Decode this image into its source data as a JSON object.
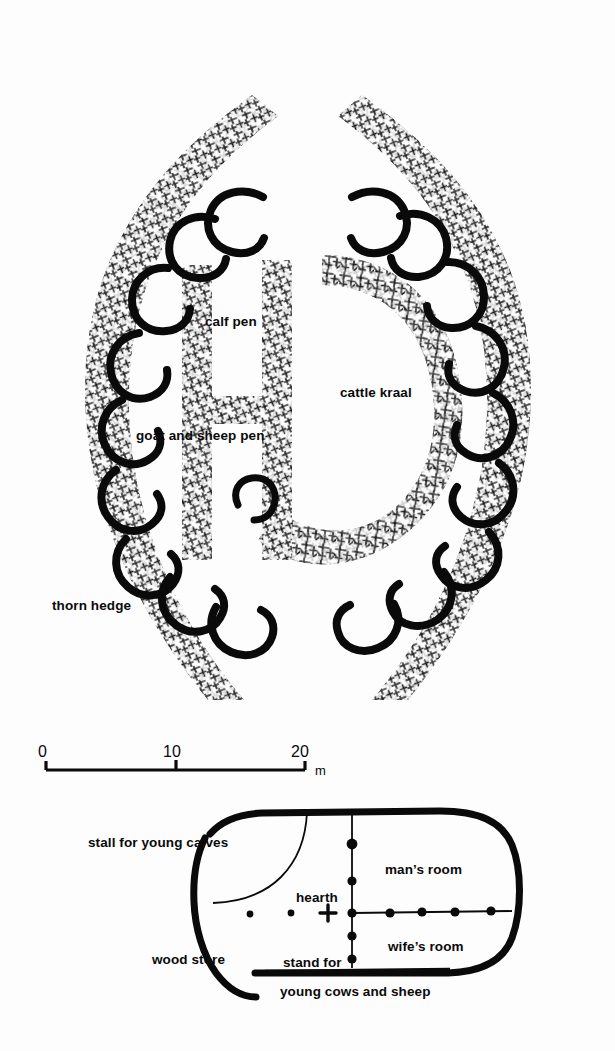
{
  "figure": {
    "background_color": "#fdfdfd",
    "ink_color": "#0a0a0a",
    "type": "architectural-plan-drawing"
  },
  "kraal_plan": {
    "labels": {
      "calf_pen": "calf pen",
      "cattle_kraal": "cattle kraal",
      "goat_and_sheep_pen": "goat and sheep pen",
      "thorn_hedge": "thorn hedge"
    }
  },
  "scale_bar": {
    "ticks": [
      "0",
      "10",
      "20"
    ],
    "unit": "m",
    "max_value": 20
  },
  "house_plan": {
    "labels": {
      "stall_for_young_calves": "stall for young calves",
      "mans_room": "man’s room",
      "hearth": "hearth",
      "wood_store": "wood store",
      "wifes_room": "wife’s room",
      "stand_for": "stand for",
      "young_cows_and_sheep": "young cows and sheep"
    }
  }
}
